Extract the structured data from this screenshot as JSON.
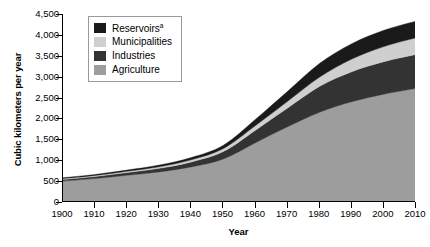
{
  "chart_data": {
    "type": "area",
    "stacked": true,
    "title": "",
    "xlabel": "Year",
    "ylabel": "Cubic kilometers per year",
    "x": [
      1900,
      1910,
      1920,
      1930,
      1940,
      1950,
      1960,
      1970,
      1980,
      1990,
      2000,
      2010
    ],
    "xlim": [
      1900,
      2010
    ],
    "ylim": [
      0,
      4500
    ],
    "yticks": [
      0,
      500,
      1000,
      1500,
      2000,
      2500,
      3000,
      3500,
      4000,
      4500
    ],
    "ytick_labels": [
      "0",
      "500",
      "1,000",
      "1,500",
      "2,000",
      "2,500",
      "3,000",
      "3,500",
      "4,000",
      "4,500"
    ],
    "xtick_labels": [
      "1900",
      "1910",
      "1920",
      "1930",
      "1940",
      "1950",
      "1960",
      "1970",
      "1980",
      "1990",
      "2000",
      "2010"
    ],
    "grid": false,
    "legend_position": "upper-left",
    "series": [
      {
        "name": "Agriculture",
        "color": "#9d9d9d",
        "values": [
          500,
          560,
          640,
          720,
          840,
          1030,
          1420,
          1800,
          2150,
          2400,
          2580,
          2720
        ]
      },
      {
        "name": "Industries",
        "color": "#333333",
        "values": [
          40,
          50,
          65,
          85,
          120,
          180,
          300,
          450,
          620,
          720,
          780,
          810
        ]
      },
      {
        "name": "Municipalities",
        "color": "#cfcfcf",
        "values": [
          20,
          24,
          30,
          38,
          50,
          70,
          110,
          160,
          220,
          300,
          360,
          400
        ]
      },
      {
        "name": "Reservoirs",
        "color": "#1a1a1a",
        "label_superscript": "a",
        "values": [
          20,
          25,
          30,
          40,
          55,
          80,
          150,
          240,
          330,
          370,
          390,
          400
        ]
      }
    ],
    "totals": [
      580,
      659,
      765,
      883,
      1065,
      1360,
      1980,
      2650,
      3320,
      3790,
      4110,
      4330
    ]
  },
  "legend": {
    "items": [
      {
        "label": "Reservoirs",
        "superscript": "a",
        "color": "#1a1a1a"
      },
      {
        "label": "Municipalities",
        "superscript": "",
        "color": "#cfcfcf"
      },
      {
        "label": "Industries",
        "superscript": "",
        "color": "#333333"
      },
      {
        "label": "Agriculture",
        "superscript": "",
        "color": "#9d9d9d"
      }
    ]
  }
}
